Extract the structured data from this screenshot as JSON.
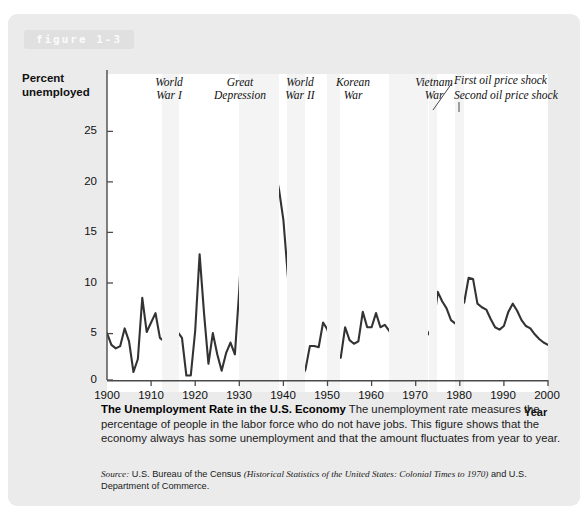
{
  "figure": {
    "tag": "figure 1-3",
    "caption_title": "The Unemployment Rate in the U.S. Economy",
    "caption_body": " The unemployment rate measures the percentage of people in the labor force who do not have jobs. This figure shows that the economy always has some unemployment and that the amount fluctuates from year to year.",
    "source_word": "Source:",
    "source_text_1": " U.S. Bureau of the Census ",
    "source_title": "(Historical Statistics of the United States: Colonial Times to 1970)",
    "source_text_2": " and U.S. Department of Commerce."
  },
  "chart_data": {
    "type": "line",
    "title": "The Unemployment Rate in the U.S. Economy",
    "xlabel": "Year",
    "ylabel": "Percent unemployed",
    "xlim": [
      1900,
      2000
    ],
    "ylim": [
      0,
      27
    ],
    "grid": false,
    "legend": "none",
    "line_color": "#333333",
    "band_color": "#f4f4f4",
    "yticks": [
      "0",
      "5",
      "10",
      "15",
      "20",
      "25"
    ],
    "ytick_values": [
      0,
      5,
      10,
      15,
      20,
      25
    ],
    "xticks": [
      "1900",
      "1910",
      "1920",
      "1930",
      "1940",
      "1950",
      "1960",
      "1970",
      "1980",
      "1990",
      "2000"
    ],
    "xtick_values": [
      1900,
      1910,
      1920,
      1930,
      1940,
      1950,
      1960,
      1970,
      1980,
      1990,
      2000
    ],
    "series": [
      {
        "name": "Percent unemployed",
        "x": [
          1900,
          1901,
          1902,
          1903,
          1904,
          1905,
          1906,
          1907,
          1908,
          1909,
          1910,
          1911,
          1912,
          1913,
          1914,
          1915,
          1916,
          1917,
          1918,
          1919,
          1920,
          1921,
          1922,
          1923,
          1924,
          1925,
          1926,
          1927,
          1928,
          1929,
          1930,
          1931,
          1932,
          1933,
          1934,
          1935,
          1936,
          1937,
          1938,
          1939,
          1940,
          1941,
          1942,
          1943,
          1944,
          1945,
          1946,
          1947,
          1948,
          1949,
          1950,
          1951,
          1952,
          1953,
          1954,
          1955,
          1956,
          1957,
          1958,
          1959,
          1960,
          1961,
          1962,
          1963,
          1964,
          1965,
          1966,
          1967,
          1968,
          1969,
          1970,
          1971,
          1972,
          1973,
          1974,
          1975,
          1976,
          1977,
          1978,
          1979,
          1980,
          1981,
          1982,
          1983,
          1984,
          1985,
          1986,
          1987,
          1988,
          1989,
          1990,
          1991,
          1992,
          1993,
          1994,
          1995,
          1996,
          1997,
          1998,
          1999,
          2000
        ],
        "y": [
          5.0,
          4.0,
          3.7,
          3.9,
          5.4,
          4.3,
          1.7,
          2.8,
          8.0,
          5.1,
          5.9,
          6.7,
          4.6,
          4.3,
          7.9,
          8.5,
          5.1,
          4.6,
          1.4,
          1.4,
          5.2,
          11.7,
          6.7,
          2.4,
          5.0,
          3.2,
          1.8,
          3.3,
          4.2,
          3.2,
          8.7,
          15.9,
          23.6,
          24.9,
          21.7,
          20.1,
          16.9,
          14.3,
          19.0,
          17.2,
          14.6,
          9.9,
          4.7,
          1.9,
          1.2,
          1.9,
          3.9,
          3.9,
          3.8,
          5.9,
          5.3,
          3.3,
          3.0,
          2.9,
          5.5,
          4.4,
          4.1,
          4.3,
          6.8,
          5.5,
          5.5,
          6.7,
          5.5,
          5.7,
          5.2,
          4.5,
          3.8,
          3.8,
          3.6,
          3.5,
          4.9,
          5.9,
          5.6,
          4.9,
          5.6,
          8.5,
          7.7,
          7.1,
          6.1,
          5.8,
          7.1,
          7.6,
          9.7,
          9.6,
          7.5,
          7.2,
          7.0,
          6.2,
          5.5,
          5.3,
          5.6,
          6.8,
          7.5,
          6.9,
          6.1,
          5.6,
          5.4,
          4.9,
          4.5,
          4.2,
          4.0
        ]
      }
    ],
    "shaded_periods": [
      {
        "label": "World\nWar I",
        "start": 1914,
        "end": 1918
      },
      {
        "label": "Great\nDepression",
        "start": 1930,
        "end": 1939
      },
      {
        "label": "World\nWar II",
        "start": 1941,
        "end": 1945
      },
      {
        "label": "Korean\nWar",
        "start": 1950,
        "end": 1953
      },
      {
        "label": "Vietnam\nWar",
        "start": 1964,
        "end": 1973
      },
      {
        "label": "First oil price shock",
        "start": 1973,
        "end": 1974
      },
      {
        "label": "Second oil price shock",
        "start": 1979,
        "end": 1980
      }
    ],
    "annotations": [
      {
        "name": "world-war-i",
        "text": "World\nWar I"
      },
      {
        "name": "great-depression",
        "text": "Great\nDepression"
      },
      {
        "name": "world-war-ii",
        "text": "World\nWar II"
      },
      {
        "name": "korean-war",
        "text": "Korean\nWar"
      },
      {
        "name": "vietnam-war",
        "text": "Vietnam\nWar"
      },
      {
        "name": "first-oil-price-shock",
        "text": "First oil price shock"
      },
      {
        "name": "second-oil-price-shock",
        "text": "Second oil price shock"
      }
    ]
  }
}
